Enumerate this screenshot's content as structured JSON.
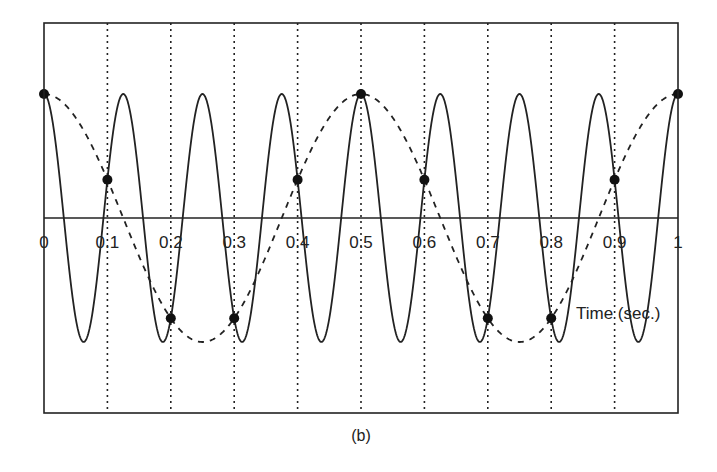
{
  "figure": {
    "caption": "(b)",
    "xlabel": "Time (sec.)"
  },
  "chart_data": {
    "type": "line",
    "title": "",
    "caption": "(b)",
    "xlabel": "Time (sec.)",
    "ylabel": "",
    "xlim": [
      0,
      1
    ],
    "ylim": [
      -1.5,
      1.5
    ],
    "x_ticks": [
      "0",
      "0.1",
      "0.2",
      "0.3",
      "0.4",
      "0.5",
      "0.6",
      "0.7",
      "0.8",
      "0.9",
      "1"
    ],
    "grid": {
      "vertical_dotted_lines_at": [
        0.1,
        0.2,
        0.3,
        0.4,
        0.5,
        0.6,
        0.7,
        0.8,
        0.9
      ]
    },
    "series": [
      {
        "name": "original signal",
        "style": "solid",
        "function": "cos(2*pi*8*t)",
        "frequency_hz": 8,
        "amplitude": 1
      },
      {
        "name": "aliased signal",
        "style": "dashed",
        "function": "cos(2*pi*2*t)",
        "frequency_hz": 2,
        "amplitude": 1
      },
      {
        "name": "samples",
        "style": "markers",
        "x": [
          0,
          0.1,
          0.2,
          0.3,
          0.4,
          0.5,
          0.6,
          0.7,
          0.8,
          0.9,
          1.0
        ],
        "y": [
          1,
          0.309,
          -0.809,
          -0.809,
          0.309,
          1,
          0.309,
          -0.809,
          -0.809,
          0.309,
          1
        ]
      }
    ],
    "sampling_rate_hz": 10,
    "legend": "none"
  }
}
